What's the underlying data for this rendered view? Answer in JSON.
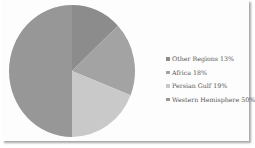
{
  "chart_data": {
    "type": "pie",
    "title": "",
    "categories": [
      "Other Regions",
      "Africa",
      "Persian Gulf",
      "Western Hemisphere"
    ],
    "values": [
      13,
      18,
      19,
      50
    ],
    "labels": [
      "Other Regions 13%",
      "Africa 18%",
      "Persian Gulf 19%",
      "Western Hemisphere 50%"
    ],
    "colors": [
      "#8c8c8c",
      "#a3a3a3",
      "#c9c9c9",
      "#979797"
    ],
    "start_angle": "12 o'clock, clockwise",
    "legend_position": "right"
  },
  "legend": {
    "items": [
      {
        "label": "Other Regions 13%",
        "color": "#8c8c8c"
      },
      {
        "label": "Africa 18%",
        "color": "#a3a3a3"
      },
      {
        "label": "Persian Gulf 19%",
        "color": "#c9c9c9"
      },
      {
        "label": "Western Hemisphere 50%",
        "color": "#979797"
      }
    ]
  }
}
